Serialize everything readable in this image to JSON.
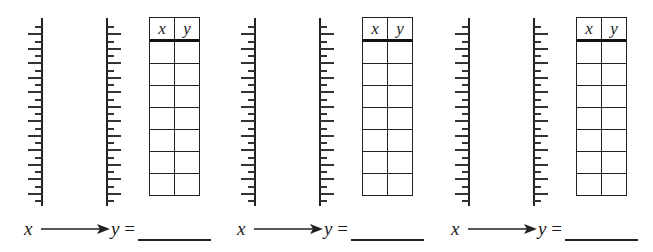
{
  "worksheet": {
    "sections": [
      {
        "id": "section-1",
        "input_axis": {
          "tick_count": 25,
          "side": "left"
        },
        "output_axis": {
          "tick_count": 25,
          "side": "right"
        },
        "table": {
          "headers": [
            "x",
            "y"
          ],
          "rows": [
            [
              "",
              ""
            ],
            [
              "",
              ""
            ],
            [
              "",
              ""
            ],
            [
              "",
              ""
            ],
            [
              "",
              ""
            ],
            [
              "",
              ""
            ],
            [
              "",
              ""
            ]
          ]
        },
        "rule": {
          "input_var": "x",
          "output_var": "y",
          "equals": "=",
          "answer": ""
        }
      },
      {
        "id": "section-2",
        "input_axis": {
          "tick_count": 25,
          "side": "left"
        },
        "output_axis": {
          "tick_count": 25,
          "side": "right"
        },
        "table": {
          "headers": [
            "x",
            "y"
          ],
          "rows": [
            [
              "",
              ""
            ],
            [
              "",
              ""
            ],
            [
              "",
              ""
            ],
            [
              "",
              ""
            ],
            [
              "",
              ""
            ],
            [
              "",
              ""
            ],
            [
              "",
              ""
            ]
          ]
        },
        "rule": {
          "input_var": "x",
          "output_var": "y",
          "equals": "=",
          "answer": ""
        }
      },
      {
        "id": "section-3",
        "input_axis": {
          "tick_count": 25,
          "side": "left"
        },
        "output_axis": {
          "tick_count": 25,
          "side": "right"
        },
        "table": {
          "headers": [
            "x",
            "y"
          ],
          "rows": [
            [
              "",
              ""
            ],
            [
              "",
              ""
            ],
            [
              "",
              ""
            ],
            [
              "",
              ""
            ],
            [
              "",
              ""
            ],
            [
              "",
              ""
            ],
            [
              "",
              ""
            ]
          ]
        },
        "rule": {
          "input_var": "x",
          "output_var": "y",
          "equals": "=",
          "answer": ""
        }
      }
    ]
  }
}
